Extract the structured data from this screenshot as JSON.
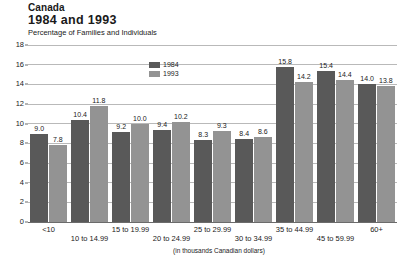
{
  "header": {
    "country": "Canada",
    "years": "1984 and 1993",
    "subtitle": "Percentage of Families and Individuals"
  },
  "footnote": "(in thousands Canadian dollars)",
  "legend": {
    "position": "inside-top-center",
    "entries": [
      {
        "label": "1984",
        "color": "#595959"
      },
      {
        "label": "1993",
        "color": "#939393"
      }
    ]
  },
  "colors": {
    "series_1984": "#595959",
    "series_1993": "#939393",
    "gridline": "#b9b9b9",
    "axis": "#6b6b6b",
    "background": "#ffffff",
    "text": "#1a1a1a"
  },
  "chart_data": {
    "type": "bar",
    "title": "Canada 1984 and 1993",
    "subtitle": "Percentage of Families and Individuals",
    "xlabel": "(in thousands Canadian dollars)",
    "ylabel": "",
    "ylim": [
      0,
      18
    ],
    "yticks": [
      0,
      2,
      4,
      6,
      8,
      10,
      12,
      14,
      16,
      18
    ],
    "grid": true,
    "grid_axis": "y",
    "legend_position": "inside top center",
    "categories": [
      "<10",
      "10 to 14.99",
      "15 to 19.99",
      "20 to 24.99",
      "25 to 29.99",
      "30 to 34.99",
      "35 to 44.99",
      "45 to 59.99",
      "60+"
    ],
    "series": [
      {
        "name": "1984",
        "color": "#595959",
        "values": [
          9.0,
          10.4,
          9.2,
          9.4,
          8.3,
          8.4,
          15.8,
          15.4,
          14.0
        ]
      },
      {
        "name": "1993",
        "color": "#939393",
        "values": [
          7.8,
          11.8,
          10.0,
          10.2,
          9.3,
          8.6,
          14.2,
          14.4,
          13.8
        ]
      }
    ]
  }
}
